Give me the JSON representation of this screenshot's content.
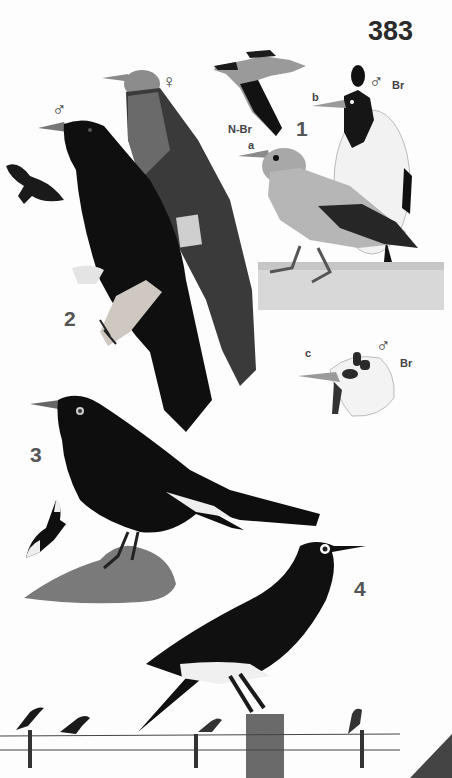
{
  "page": {
    "number": "383"
  },
  "labels": {
    "species_1": "1",
    "species_2": "2",
    "species_3": "3",
    "species_4": "4",
    "sub_a": "a",
    "sub_b": "b",
    "sub_c": "c",
    "nonbreeding": "N-Br",
    "breeding_b": "Br",
    "breeding_c": "Br",
    "male_b": "♂",
    "male_c": "♂",
    "male_2": "♂",
    "female_2": "♀"
  },
  "figures": [
    {
      "id": "1-flight",
      "description": "pale starling in flight, non-breeding",
      "label": "N-Br"
    },
    {
      "id": "1a",
      "description": "pale grey starling perched on ledge",
      "label": "a"
    },
    {
      "id": "1b",
      "description": "white-bodied male with black wattles, breeding",
      "label": "b",
      "sex": "♂",
      "status": "Br"
    },
    {
      "id": "1c",
      "description": "head of breeding male with wattles",
      "label": "c",
      "sex": "♂",
      "status": "Br"
    },
    {
      "id": "2-male",
      "description": "black long-tailed starling male perched",
      "sex": "♂"
    },
    {
      "id": "2-female",
      "description": "streaked grey-headed female",
      "sex": "♀"
    },
    {
      "id": "2-flight",
      "description": "dark bird in flight"
    },
    {
      "id": "3",
      "description": "black bird with white wing patch on rock"
    },
    {
      "id": "3-flight",
      "description": "black bird in flight with white wing tips"
    },
    {
      "id": "4",
      "description": "black starling with white eye-ring on post"
    },
    {
      "id": "4-wire",
      "description": "small birds perched on wire"
    }
  ],
  "colors": {
    "background": "#fdfdfd",
    "ink": "#111111",
    "label": "#3a3a3a",
    "corner_tab": "#444444"
  }
}
